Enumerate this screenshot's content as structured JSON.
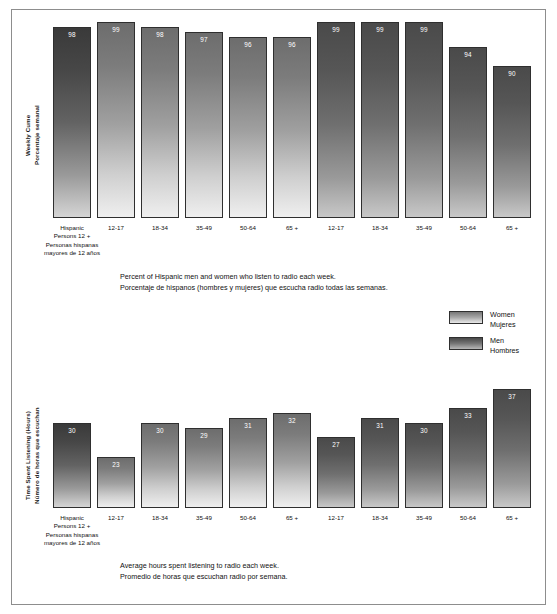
{
  "chart_data": [
    {
      "type": "bar",
      "id": "weekly-cume",
      "title": "",
      "ylabel_en": "Weekly Cume",
      "ylabel_es": "Porcentaje semanal",
      "ylim": [
        0,
        100
      ],
      "grid": false,
      "legend_position": "middle-right",
      "categories": [
        "Hispanic Persons 12 +",
        "12-17",
        "18-34",
        "35-49",
        "50-64",
        "65 +",
        "12-17",
        "18-34",
        "35-49",
        "50-64",
        "65 +"
      ],
      "values": [
        98,
        99,
        98,
        97,
        96,
        96,
        99,
        99,
        99,
        94,
        90
      ],
      "series": [
        {
          "name": "Total",
          "categories": [
            "Hispanic Persons 12 +"
          ],
          "values": [
            98
          ]
        },
        {
          "name": "Women",
          "categories": [
            "12-17",
            "18-34",
            "35-49",
            "50-64",
            "65 +"
          ],
          "values": [
            99,
            98,
            97,
            96,
            96
          ]
        },
        {
          "name": "Men",
          "categories": [
            "12-17",
            "18-34",
            "35-49",
            "50-64",
            "65 +"
          ],
          "values": [
            99,
            99,
            99,
            94,
            90
          ]
        }
      ],
      "caption_en": "Percent of Hispanic men and women who listen to radio each week.",
      "caption_es": "Porcentaje de hispanos (hombres y mujeres) que escucha radio todas las semanas."
    },
    {
      "type": "bar",
      "id": "time-spent-listening",
      "title": "",
      "ylabel_en": "Time Spent Listening (Hours)",
      "ylabel_es": "Número de horas que escuchan",
      "ylim": [
        0,
        40
      ],
      "grid": false,
      "categories": [
        "Hispanic Persons 12 +",
        "12-17",
        "18-34",
        "35-49",
        "50-64",
        "65 +",
        "12-17",
        "18-34",
        "35-49",
        "50-64",
        "65 +"
      ],
      "values": [
        30,
        23,
        30,
        29,
        31,
        32,
        27,
        31,
        30,
        33,
        37
      ],
      "series": [
        {
          "name": "Total",
          "categories": [
            "Hispanic Persons 12 +"
          ],
          "values": [
            30
          ]
        },
        {
          "name": "Women",
          "categories": [
            "12-17",
            "18-34",
            "35-49",
            "50-64",
            "65 +"
          ],
          "values": [
            23,
            30,
            29,
            31,
            32
          ]
        },
        {
          "name": "Men",
          "categories": [
            "12-17",
            "18-34",
            "35-49",
            "50-64",
            "65 +"
          ],
          "values": [
            27,
            31,
            30,
            33,
            37
          ]
        }
      ],
      "caption_en": "Average hours spent listening to radio each week.",
      "caption_es": "Promedio de horas que escuchan radio por semana."
    }
  ],
  "top_chart": {
    "axis_title_en": "Weekly Cume",
    "axis_title_es": "Porcentaje semanal",
    "bars": [
      {
        "label_line1": "Hispanic",
        "label_line2": "Persons 12 +",
        "sub_line1": "Personas hispanas",
        "sub_line2": "mayores de 12 años",
        "value": "98",
        "style": "first"
      },
      {
        "label_line1": "12-17",
        "label_line2": "",
        "value": "99",
        "style": "women"
      },
      {
        "label_line1": "18-34",
        "label_line2": "",
        "value": "98",
        "style": "women"
      },
      {
        "label_line1": "35-49",
        "label_line2": "",
        "value": "97",
        "style": "women"
      },
      {
        "label_line1": "50-64",
        "label_line2": "",
        "value": "96",
        "style": "women"
      },
      {
        "label_line1": "65 +",
        "label_line2": "",
        "value": "96",
        "style": "women"
      },
      {
        "label_line1": "12-17",
        "label_line2": "",
        "value": "99",
        "style": "men"
      },
      {
        "label_line1": "18-34",
        "label_line2": "",
        "value": "99",
        "style": "men"
      },
      {
        "label_line1": "35-49",
        "label_line2": "",
        "value": "99",
        "style": "men"
      },
      {
        "label_line1": "50-64",
        "label_line2": "",
        "value": "94",
        "style": "men"
      },
      {
        "label_line1": "65 +",
        "label_line2": "",
        "value": "90",
        "style": "men"
      }
    ],
    "caption_en": "Percent of Hispanic men and women who listen to radio each week.",
    "caption_es": "Porcentaje de hispanos (hombres y mujeres) que escucha radio todas las semanas."
  },
  "bottom_chart": {
    "axis_title_en": "Time Spent Listening (Hours)",
    "axis_title_es": "Número de horas que escuchan",
    "bars": [
      {
        "label_line1": "Hispanic",
        "label_line2": "Persons 12 +",
        "sub_line1": "Personas hispanas",
        "sub_line2": "mayores de 12 años",
        "value": "30",
        "style": "first"
      },
      {
        "label_line1": "12-17",
        "label_line2": "",
        "value": "23",
        "style": "women"
      },
      {
        "label_line1": "18-34",
        "label_line2": "",
        "value": "30",
        "style": "women"
      },
      {
        "label_line1": "35-49",
        "label_line2": "",
        "value": "29",
        "style": "women"
      },
      {
        "label_line1": "50-64",
        "label_line2": "",
        "value": "31",
        "style": "women"
      },
      {
        "label_line1": "65 +",
        "label_line2": "",
        "value": "32",
        "style": "women"
      },
      {
        "label_line1": "12-17",
        "label_line2": "",
        "value": "27",
        "style": "men"
      },
      {
        "label_line1": "18-34",
        "label_line2": "",
        "value": "31",
        "style": "men"
      },
      {
        "label_line1": "35-49",
        "label_line2": "",
        "value": "30",
        "style": "men"
      },
      {
        "label_line1": "50-64",
        "label_line2": "",
        "value": "33",
        "style": "men"
      },
      {
        "label_line1": "65 +",
        "label_line2": "",
        "value": "37",
        "style": "men"
      }
    ],
    "caption_en": "Average hours spent listening to radio each week.",
    "caption_es": "Promedio de horas que escuchan radio por semana."
  },
  "legend": {
    "items": [
      {
        "label_en": "Women",
        "label_es": "Mujeres",
        "style": "women"
      },
      {
        "label_en": "Men",
        "label_es": "Hombres",
        "style": "men"
      }
    ]
  },
  "colors": {
    "bar_women_top": "#6d6d6d",
    "bar_women_bottom": "#efefef",
    "bar_men_top": "#4a4a4a",
    "bar_men_bottom": "#c8c8c8",
    "bar_first_top": "#3a3a3a",
    "border": "#2f2f2f",
    "frame": "#8d8d8d",
    "text": "#111111",
    "value_text": "#ffffff",
    "background": "#ffffff"
  }
}
